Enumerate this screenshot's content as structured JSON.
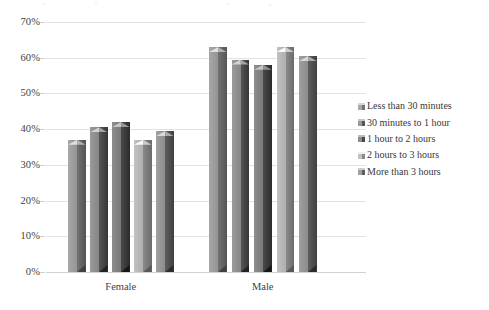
{
  "chart_data": {
    "type": "bar",
    "title": "",
    "subtitle": "",
    "xlabel": "",
    "ylabel": "",
    "categories": [
      "Female",
      "Male"
    ],
    "series": [
      {
        "name": "Less than 30 minutes",
        "values": [
          37.0,
          63.0
        ],
        "color_light": "#a8a8a8",
        "color_dark": "#737373"
      },
      {
        "name": "30 minutes to 1 hour",
        "values": [
          40.5,
          59.5
        ],
        "color_light": "#9a9a9a",
        "color_dark": "#555555"
      },
      {
        "name": "1 hour to 2 hours",
        "values": [
          42.0,
          58.0
        ],
        "color_light": "#8d8d8d",
        "color_dark": "#4a4a4a"
      },
      {
        "name": "2 hours to 3 hours",
        "values": [
          37.0,
          63.0
        ],
        "color_light": "#c2c2c2",
        "color_dark": "#8a8a8a"
      },
      {
        "name": "More than 3 hours",
        "values": [
          39.5,
          60.5
        ],
        "color_light": "#a0a0a0",
        "color_dark": "#5e5e5e"
      }
    ],
    "ylim": [
      0,
      70
    ],
    "ytick_values": [
      70,
      60,
      50,
      40,
      30,
      20,
      10,
      0
    ],
    "ytick_labels": [
      "70%",
      "60%",
      "50%",
      "40%",
      "30%",
      "20%",
      "10%",
      "0%"
    ],
    "grid": true,
    "grid_axis": "y",
    "legend_position": "right",
    "value_format": "percent",
    "style": "3d-column-clustered"
  },
  "axes": {
    "y": {
      "ticks": [
        {
          "label": "70%",
          "value": 70
        },
        {
          "label": "60%",
          "value": 60
        },
        {
          "label": "50%",
          "value": 50
        },
        {
          "label": "40%",
          "value": 40
        },
        {
          "label": "30%",
          "value": 30
        },
        {
          "label": "20%",
          "value": 20
        },
        {
          "label": "10%",
          "value": 10
        },
        {
          "label": "0%",
          "value": 0
        }
      ]
    },
    "x": {
      "ticks": [
        {
          "label": "Female"
        },
        {
          "label": "Male"
        }
      ]
    }
  },
  "legend": {
    "items": [
      {
        "label": "Less than 30 minutes"
      },
      {
        "label": "30 minutes to 1 hour"
      },
      {
        "label": "1 hour to 2 hours"
      },
      {
        "label": "2 hours to 3 hours"
      },
      {
        "label": "More than 3 hours"
      }
    ]
  },
  "colors": {
    "gridline": "#e2e2e2",
    "text": "#3a3a3a",
    "background": "#ffffff"
  }
}
